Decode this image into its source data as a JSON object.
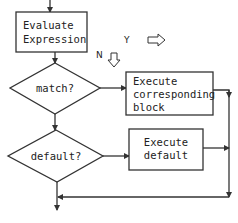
{
  "diagram": {
    "colors": {
      "stroke": "#333333",
      "text": "#222222",
      "background": "#ffffff"
    },
    "nodes": {
      "evaluate": {
        "type": "process",
        "lines": [
          "Evaluate",
          "Expression"
        ]
      },
      "match": {
        "type": "decision",
        "label": "match?"
      },
      "execute_block": {
        "type": "process",
        "lines": [
          "Execute",
          "corresponding",
          "block"
        ]
      },
      "default": {
        "type": "decision",
        "label": "default?"
      },
      "execute_default": {
        "type": "process",
        "lines": [
          "Execute",
          "default"
        ]
      }
    },
    "legend": {
      "yes_label": "Y",
      "yes_direction": "right-arrow",
      "no_label": "N",
      "no_direction": "down-arrow"
    },
    "edges": [
      {
        "from": "entry",
        "to": "evaluate"
      },
      {
        "from": "evaluate",
        "to": "match"
      },
      {
        "from": "match",
        "to": "execute_block",
        "branch": "Y"
      },
      {
        "from": "match",
        "to": "default",
        "branch": "N"
      },
      {
        "from": "default",
        "to": "execute_default",
        "branch": "Y"
      },
      {
        "from": "default",
        "to": "exit",
        "branch": "N"
      },
      {
        "from": "execute_block",
        "to": "exit"
      },
      {
        "from": "execute_default",
        "to": "exit"
      }
    ]
  }
}
